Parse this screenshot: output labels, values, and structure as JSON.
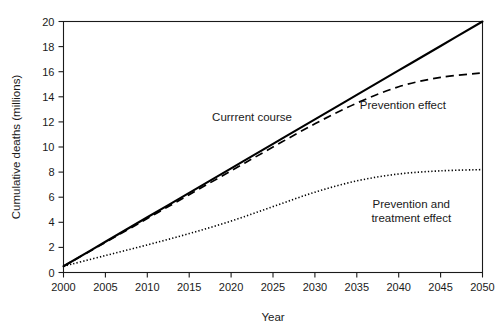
{
  "chart_data": {
    "type": "line",
    "title": "",
    "xlabel": "Year",
    "ylabel": "Cumulative deaths (millions)",
    "xlim": [
      2000,
      2050
    ],
    "ylim": [
      0,
      20
    ],
    "grid": false,
    "legend_position": "inline-annotations",
    "xticks": [
      2000,
      2005,
      2010,
      2015,
      2020,
      2025,
      2030,
      2035,
      2040,
      2045,
      2050
    ],
    "xtick_labels": [
      "2000",
      "2005",
      "2010",
      "2015",
      "2020",
      "2025",
      "2030",
      "2035",
      "2040",
      "2045",
      "2050"
    ],
    "yticks": [
      0,
      2,
      4,
      6,
      8,
      10,
      12,
      14,
      16,
      18,
      20
    ],
    "ytick_labels": [
      "0",
      "2",
      "4",
      "6",
      "8",
      "10",
      "12",
      "14",
      "16",
      "18",
      "20"
    ],
    "x": [
      2000,
      2005,
      2010,
      2015,
      2020,
      2025,
      2030,
      2035,
      2040,
      2045,
      2050
    ],
    "series": [
      {
        "name": "Currrent course",
        "style": "solid",
        "color": "#000000",
        "values": [
          0.5,
          2.45,
          4.4,
          6.35,
          8.3,
          10.25,
          12.2,
          14.15,
          16.1,
          18.05,
          20.0
        ]
      },
      {
        "name": "Prevention effect",
        "style": "dashed",
        "color": "#000000",
        "values": [
          0.5,
          2.4,
          4.3,
          6.2,
          8.1,
          10.0,
          11.85,
          13.5,
          14.8,
          15.55,
          15.9
        ]
      },
      {
        "name": "Prevention and treatment effect",
        "style": "dotted",
        "color": "#000000",
        "values": [
          0.5,
          1.35,
          2.2,
          3.1,
          4.1,
          5.25,
          6.4,
          7.3,
          7.85,
          8.1,
          8.2
        ]
      }
    ],
    "annotations": [
      {
        "text": "Currrent course",
        "x": 2022.5,
        "y": 12.1,
        "anchor": "middle"
      },
      {
        "text": "Prevention effect",
        "x": 2040.5,
        "y": 13.0,
        "anchor": "middle"
      },
      {
        "text": "Prevention and",
        "x": 2041.5,
        "y": 5.1,
        "anchor": "middle"
      },
      {
        "text": "treatment effect",
        "x": 2041.5,
        "y": 4.0,
        "anchor": "middle"
      }
    ]
  }
}
